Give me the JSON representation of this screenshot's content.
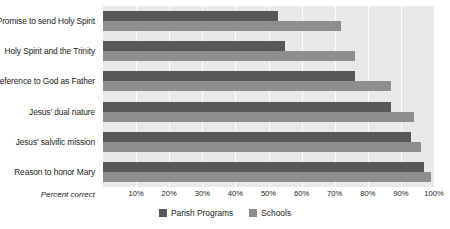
{
  "chart_data": {
    "type": "bar",
    "orientation": "horizontal",
    "title": "",
    "xlabel": "Percent correct",
    "ylabel": "",
    "xlim": [
      0,
      100
    ],
    "xticks": [
      "10%",
      "20%",
      "30%",
      "40%",
      "50%",
      "60%",
      "70%",
      "80%",
      "90%",
      "100%"
    ],
    "xtick_values": [
      10,
      20,
      30,
      40,
      50,
      60,
      70,
      80,
      90,
      100
    ],
    "grid": true,
    "legend_position": "bottom-center",
    "categories": [
      "Promise to send Holy Spirit",
      "Holy Spirit and the Trinity",
      "Reference to God as Father",
      "Jesus' dual nature",
      "Jesus' salvific mission",
      "Reason to honor Mary"
    ],
    "series": [
      {
        "name": "Parish Programs",
        "color": "#58585a",
        "values": [
          53,
          55,
          76,
          87,
          93,
          97
        ]
      },
      {
        "name": "Schools",
        "color": "#8e8e90",
        "values": [
          72,
          76,
          87,
          94,
          96,
          99
        ]
      }
    ]
  },
  "colors": {
    "plot_background": "#e9e9e9",
    "gridline": "#fdfdfd",
    "text": "#1b1b1b",
    "page_background": "#ffffff"
  }
}
